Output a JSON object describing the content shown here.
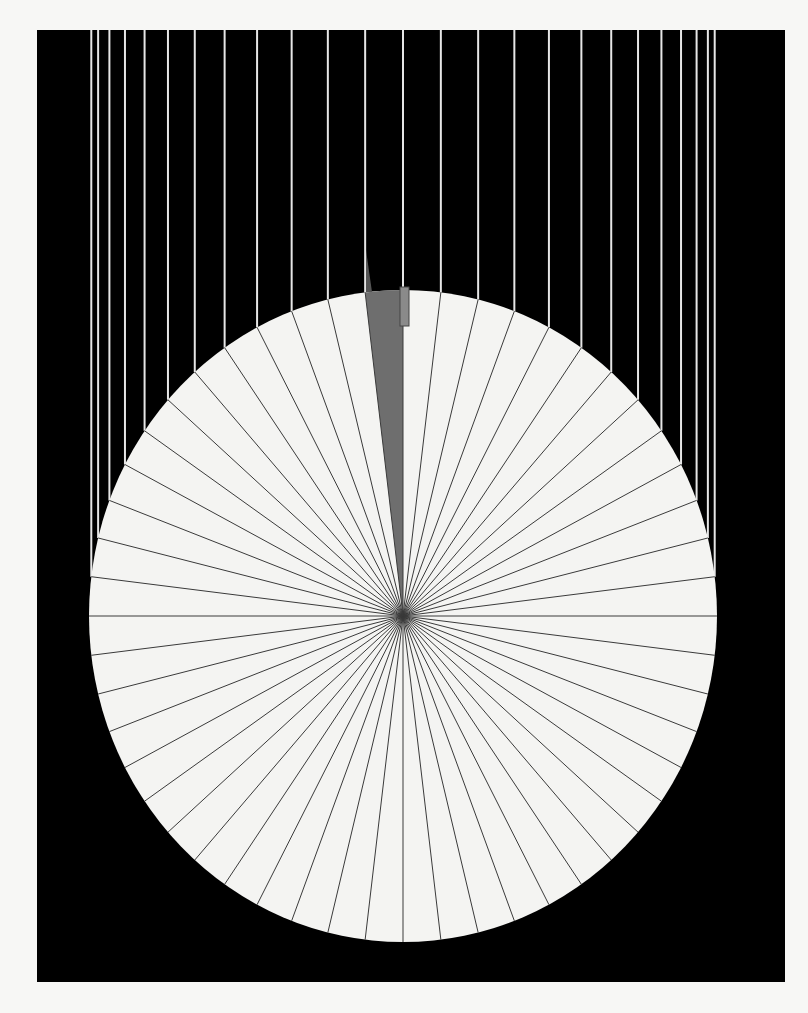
{
  "artwork": {
    "background_color": "#f7f7f5",
    "panel": {
      "x": 37,
      "y": 30,
      "width": 748,
      "height": 952,
      "color": "#000000"
    },
    "disc": {
      "cx": 403,
      "cy": 616,
      "rx": 314,
      "ry": 326,
      "fill": "#f4f4f2",
      "stroke": "#3a3a3a"
    },
    "segments": 52,
    "highlight_segment": {
      "index": 51,
      "fill": "#6e6e6e"
    },
    "drip_lines": {
      "color": "#e6e6e6",
      "width": 2,
      "top": 30
    },
    "marker": {
      "x": 400,
      "y": 287,
      "width": 9,
      "height": 39,
      "fill": "#8a8a8a",
      "stroke": "#444444"
    },
    "shadow_spike": {
      "points": "366,250 372,292 366,292",
      "fill": "#555555"
    }
  }
}
